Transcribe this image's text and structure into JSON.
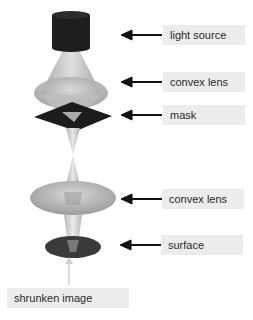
{
  "diagram": {
    "title": "",
    "colors": {
      "light_source": "#1e1e1e",
      "lens": "#b8b8b8",
      "mask": "#1c1c1c",
      "surface": "#3a3a3a",
      "arrow": "#111111",
      "label_bg": "#ececec",
      "label_text": "#2a2a2a"
    },
    "labels": [
      {
        "id": "light-source",
        "text": "light source"
      },
      {
        "id": "convex-lens-top",
        "text": "convex lens"
      },
      {
        "id": "mask",
        "text": "mask"
      },
      {
        "id": "convex-lens-bottom",
        "text": "convex lens"
      },
      {
        "id": "surface",
        "text": "surface"
      },
      {
        "id": "shrunken-image",
        "text": "shrunken image"
      }
    ]
  }
}
